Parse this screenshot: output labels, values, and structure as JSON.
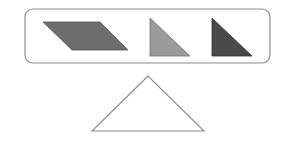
{
  "canvas": {
    "width": 291,
    "height": 143,
    "background": "#ffffff"
  },
  "option_box": {
    "x": 25,
    "y": 9,
    "width": 245,
    "height": 54,
    "radius": 8,
    "stroke": "#8c8c8c",
    "fill": "#ffffff"
  },
  "pieces": [
    {
      "name": "parallelogram",
      "points": "43,22 100,22 128,50 72,50",
      "fill": "#6e6e6e",
      "stroke": "#555555"
    },
    {
      "name": "light-right-triangle",
      "points": "150,18 150,56 190,56",
      "fill": "#9b9b9b",
      "stroke": "#707070"
    },
    {
      "name": "dark-right-triangle",
      "points": "212,18 212,56 252,56",
      "fill": "#4a4a4a",
      "stroke": "#333333"
    }
  ],
  "target_shape": {
    "name": "outline-triangle",
    "points": "148,76 92,131 204,131",
    "fill": "#ffffff",
    "stroke": "#8a8a8a"
  }
}
